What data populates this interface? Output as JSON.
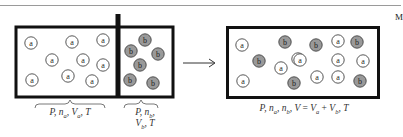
{
  "figure": {
    "corner_letter": "M",
    "arrow": "→",
    "colors": {
      "wall": "#111111",
      "a_fill": "#ffffff",
      "b_fill": "#999999",
      "outline": "#444444",
      "rule": "#9a9a9a"
    },
    "before": {
      "left_compartment": {
        "molecule_label": "a",
        "molecules": [
          [
            31,
            43
          ],
          [
            72,
            42
          ],
          [
            103,
            40
          ],
          [
            52,
            60
          ],
          [
            83,
            60
          ],
          [
            103,
            65
          ],
          [
            32,
            80
          ],
          [
            68,
            76
          ],
          [
            92,
            81
          ]
        ],
        "caption": {
          "P": "P",
          "n": "n",
          "n_sub": "a",
          "V": "V",
          "V_sub": "a",
          "T": "T"
        }
      },
      "right_compartment": {
        "molecule_label": "b",
        "molecules": [
          [
            131,
            51
          ],
          [
            145,
            40
          ],
          [
            158,
            54
          ],
          [
            140,
            65
          ],
          [
            130,
            80
          ],
          [
            153,
            83
          ]
        ],
        "caption_line1": {
          "P": "P",
          "n": "n",
          "n_sub": "b"
        },
        "caption_line2": {
          "V": "V",
          "V_sub": "b",
          "T": "T"
        }
      }
    },
    "after": {
      "molecules_a": [
        [
          242,
          45
        ],
        [
          281,
          68
        ],
        [
          298,
          59
        ],
        [
          243,
          81
        ],
        [
          338,
          41
        ],
        [
          300,
          60
        ],
        [
          338,
          60
        ],
        [
          363,
          61
        ],
        [
          317,
          77
        ],
        [
          338,
          77
        ]
      ],
      "molecules_b": [
        [
          285,
          42
        ],
        [
          259,
          61
        ],
        [
          294,
          83
        ],
        [
          316,
          45
        ],
        [
          357,
          42
        ],
        [
          360,
          81
        ]
      ],
      "caption": {
        "P": "P",
        "na": "n",
        "na_sub": "a",
        "nb": "n",
        "nb_sub": "b",
        "V": "V",
        "eq": "=",
        "Va": "V",
        "Va_sub": "a",
        "plus": "+",
        "Vb": "V",
        "Vb_sub": "b",
        "T": "T"
      }
    }
  }
}
